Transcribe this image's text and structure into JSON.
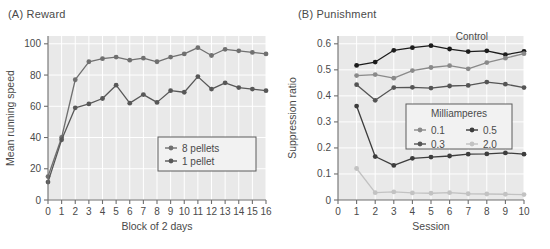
{
  "figure": {
    "panel_a": {
      "label": "(A)",
      "title": "Reward",
      "full": "(A)  Reward"
    },
    "panel_b": {
      "label": "(B)",
      "title": "Punishment",
      "full": "(B)  Punishment"
    }
  },
  "chart_data": [
    {
      "id": "reward",
      "type": "line",
      "title": "(A)  Reward",
      "xlabel": "Block of 2 days",
      "ylabel": "Mean running speed",
      "xlim": [
        0,
        16
      ],
      "ylim": [
        0,
        105
      ],
      "yticks": [
        0,
        20,
        40,
        60,
        80,
        100
      ],
      "xticks": [
        0,
        1,
        2,
        3,
        4,
        5,
        6,
        7,
        8,
        9,
        10,
        11,
        12,
        13,
        14,
        15,
        16
      ],
      "grid": true,
      "legend_position": "lower-right",
      "legend_title": "",
      "x": [
        0,
        1,
        2,
        3,
        4,
        5,
        6,
        7,
        8,
        9,
        10,
        11,
        12,
        13,
        14,
        15,
        16
      ],
      "series": [
        {
          "name": "8 pellets",
          "color": "#707070",
          "values": [
            15,
            40,
            77,
            88.5,
            90.5,
            91.5,
            89.5,
            90.8,
            88.5,
            91.5,
            93.5,
            97.5,
            92.5,
            96.5,
            95.5,
            94.5,
            93.5
          ]
        },
        {
          "name": "1 pellet",
          "color": "#585858",
          "values": [
            11.5,
            38.5,
            59,
            61.5,
            65,
            73.5,
            62,
            67.5,
            62.5,
            70,
            69,
            79,
            71,
            75,
            72,
            71,
            70
          ]
        }
      ]
    },
    {
      "id": "punishment",
      "type": "line",
      "title": "(B)  Punishment",
      "xlabel": "Session",
      "ylabel": "Suppression ratio",
      "xlim": [
        0,
        10
      ],
      "ylim": [
        0,
        0.63
      ],
      "yticks": [
        0.1,
        0.2,
        0.3,
        0.4,
        0.5,
        0.6
      ],
      "xticks": [
        0,
        1,
        2,
        3,
        4,
        5,
        6,
        7,
        8,
        9,
        10
      ],
      "grid": true,
      "legend_position": "middle-right",
      "legend_title": "Milliamperes",
      "annotations": [
        {
          "text": "Control",
          "x": 7.2,
          "y": 0.615
        }
      ],
      "x": [
        1,
        2,
        3,
        4,
        5,
        6,
        7,
        8,
        9,
        10
      ],
      "series": [
        {
          "name": "Control",
          "legend": false,
          "color": "#1c1c1c",
          "values": [
            0.517,
            0.53,
            0.575,
            0.585,
            0.593,
            0.58,
            0.57,
            0.573,
            0.558,
            0.571
          ]
        },
        {
          "name": "0.1",
          "color": "#8a8a8a",
          "values": [
            0.478,
            0.482,
            0.468,
            0.497,
            0.509,
            0.516,
            0.504,
            0.528,
            0.545,
            0.562
          ]
        },
        {
          "name": "0.3",
          "color": "#555555",
          "values": [
            0.443,
            0.383,
            0.432,
            0.433,
            0.43,
            0.438,
            0.44,
            0.453,
            0.445,
            0.432
          ]
        },
        {
          "name": "0.5",
          "color": "#3d3d3d",
          "values": [
            0.361,
            0.167,
            0.133,
            0.16,
            0.165,
            0.169,
            0.176,
            0.177,
            0.181,
            0.176
          ]
        },
        {
          "name": "2.0",
          "color": "#c2c2c2",
          "values": [
            0.121,
            0.028,
            0.031,
            0.027,
            0.026,
            0.028,
            0.024,
            0.023,
            0.022,
            0.021
          ]
        }
      ],
      "legend_entries": [
        {
          "name": "0.1",
          "color": "#8a8a8a"
        },
        {
          "name": "0.5",
          "color": "#3d3d3d"
        },
        {
          "name": "0.3",
          "color": "#555555"
        },
        {
          "name": "2.0",
          "color": "#c2c2c2"
        }
      ]
    }
  ]
}
